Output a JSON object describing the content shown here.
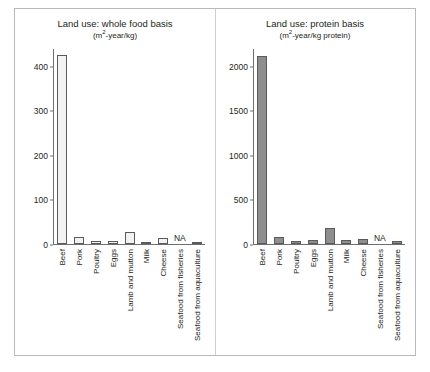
{
  "figure": {
    "panel_divider": true,
    "border_color": "#b9b9b9"
  },
  "chart_data": [
    {
      "type": "bar",
      "panel": "left",
      "title": "Land use: whole food basis",
      "subtitle_prefix": "(m",
      "subtitle_sup": "2",
      "subtitle_suffix": "-year/kg)",
      "subtitle": "(m2-year/kg)",
      "xlabel": "",
      "ylabel": "",
      "ylim": [
        0,
        440
      ],
      "yticks": [
        0,
        100,
        200,
        300,
        400
      ],
      "ytick_labels": [
        "0",
        "100",
        "200",
        "300",
        "400"
      ],
      "grid": false,
      "legend": "none",
      "bar_style": "hollow",
      "bar_fill": "#f2f2f2",
      "bar_edge": "#5a5a5a",
      "categories": [
        "Beef",
        "Pork",
        "Poultry",
        "Eggs",
        "Lamb and mutton",
        "Milk",
        "Cheese",
        "Seafood from fisheries",
        "Seafood from aquaculture"
      ],
      "values": [
        425,
        15,
        7,
        6,
        28,
        2,
        13,
        null,
        3
      ],
      "annotations": [
        {
          "category": "Seafood from fisheries",
          "text": "NA"
        }
      ]
    },
    {
      "type": "bar",
      "panel": "right",
      "title": "Land use: protein basis",
      "subtitle_prefix": "(m",
      "subtitle_sup": "2",
      "subtitle_suffix": "-year/kg protein)",
      "subtitle": "(m2-year/kg protein)",
      "xlabel": "",
      "ylabel": "",
      "ylim": [
        0,
        2200
      ],
      "yticks": [
        0,
        500,
        1000,
        1500,
        2000
      ],
      "ytick_labels": [
        "0",
        "500",
        "1000",
        "1500",
        "2000"
      ],
      "grid": false,
      "legend": "none",
      "bar_style": "solid",
      "bar_fill": "#8e8e8e",
      "bar_edge": "#5a5a5a",
      "categories": [
        "Beef",
        "Pork",
        "Poultry",
        "Eggs",
        "Lamb and mutton",
        "Milk",
        "Cheese",
        "Seafood from fisheries",
        "Seafood from aquaculture"
      ],
      "values": [
        2110,
        75,
        35,
        40,
        185,
        45,
        55,
        null,
        30
      ],
      "annotations": [
        {
          "category": "Seafood from fisheries",
          "text": "NA"
        }
      ]
    }
  ]
}
